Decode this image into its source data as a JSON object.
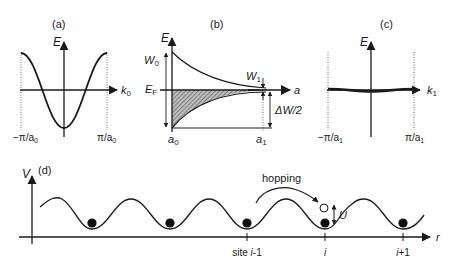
{
  "panels": {
    "a": {
      "label": "(a)",
      "y_axis": "E",
      "x_axis": "k",
      "x_axis_sub": "0",
      "left_tick": "−π/a",
      "left_tick_sub": "0",
      "right_tick": "π/a",
      "right_tick_sub": "0"
    },
    "b": {
      "label": "(b)",
      "y_axis": "E",
      "x_axis": "a",
      "fermi": "E",
      "fermi_sub": "F",
      "w0": "W",
      "w0_sub": "0",
      "w1": "W",
      "w1_sub": "1",
      "delta_w": "ΔW/2",
      "left_tick": "a",
      "left_tick_sub": "0",
      "right_tick": "a",
      "right_tick_sub": "1"
    },
    "c": {
      "label": "(c)",
      "y_axis": "E",
      "x_axis": "k",
      "x_axis_sub": "1",
      "left_tick": "−π/a",
      "left_tick_sub": "1",
      "right_tick": "π/a",
      "right_tick_sub": "1"
    },
    "d": {
      "label": "(d)",
      "y_axis": "V",
      "x_axis": "r",
      "hopping": "hopping",
      "u_label": "U",
      "sites": [
        {
          "prefix": "site ",
          "var": "i",
          "suffix": "-1"
        },
        {
          "prefix": "",
          "var": "i",
          "suffix": ""
        },
        {
          "prefix": "",
          "var": "i",
          "suffix": "+1"
        }
      ]
    }
  },
  "colors": {
    "ink": "#1a1a1a",
    "hatch": "#555555"
  }
}
